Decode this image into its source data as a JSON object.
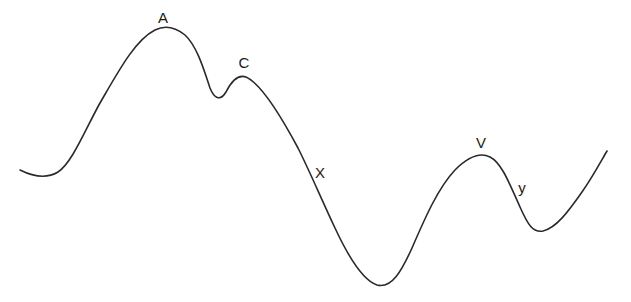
{
  "diagram": {
    "type": "curve-with-labeled-points",
    "stroke_color": "#2a2a2a",
    "background": "#ffffff",
    "labels": [
      {
        "id": "A",
        "text": "A",
        "x": 163,
        "y": 17,
        "description": "global peak"
      },
      {
        "id": "C",
        "text": "C",
        "x": 244,
        "y": 62,
        "description": "secondary peak"
      },
      {
        "id": "X",
        "text": "X",
        "x": 320,
        "y": 172,
        "description": "point on descending slope"
      },
      {
        "id": "V",
        "text": "V",
        "x": 481,
        "y": 142,
        "description": "right peak"
      },
      {
        "id": "y",
        "text": "y",
        "x": 522,
        "y": 187,
        "description": "point on descending slope after V"
      }
    ],
    "curve_points": [
      [
        20,
        170
      ],
      [
        42,
        175
      ],
      [
        68,
        162
      ],
      [
        100,
        100
      ],
      [
        135,
        45
      ],
      [
        163,
        28
      ],
      [
        190,
        40
      ],
      [
        217,
        98
      ],
      [
        243,
        76
      ],
      [
        275,
        110
      ],
      [
        313,
        180
      ],
      [
        350,
        260
      ],
      [
        377,
        285
      ],
      [
        405,
        262
      ],
      [
        440,
        190
      ],
      [
        483,
        155
      ],
      [
        510,
        175
      ],
      [
        538,
        231
      ],
      [
        570,
        210
      ],
      [
        607,
        151
      ]
    ]
  }
}
